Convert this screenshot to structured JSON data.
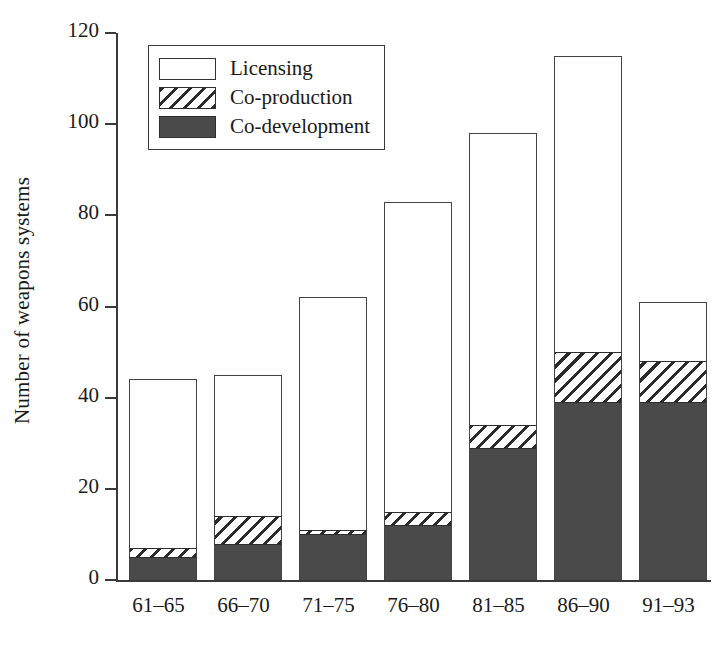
{
  "chart_data": {
    "type": "bar",
    "subtype": "stacked-bar",
    "title": "",
    "xlabel": "",
    "ylabel": "Number of weapons systems",
    "ylim": [
      0,
      120
    ],
    "yticks": [
      0,
      20,
      40,
      60,
      80,
      100,
      120
    ],
    "grid": false,
    "legend_position": "top-left-inside",
    "categories": [
      "61–65",
      "66–70",
      "71–75",
      "76–80",
      "81–85",
      "86–90",
      "91–93"
    ],
    "series": [
      {
        "name": "Co-development",
        "color": "#4a4a4a",
        "pattern": "solid",
        "values": [
          5,
          8,
          10,
          12,
          29,
          39,
          39
        ]
      },
      {
        "name": "Co-production",
        "color": "#2b2b2b",
        "pattern": "hatched",
        "values": [
          2,
          6,
          1,
          3,
          5,
          11,
          9
        ]
      },
      {
        "name": "Licensing",
        "color": "#ffffff",
        "pattern": "open",
        "values": [
          37,
          31,
          51,
          68,
          64,
          65,
          13
        ]
      }
    ],
    "totals": [
      44,
      45,
      62,
      83,
      98,
      115,
      61
    ],
    "stack_order": [
      "Co-development",
      "Co-production",
      "Licensing"
    ]
  },
  "legend": {
    "items": [
      {
        "label": "Licensing",
        "swatch": "open-rect-icon"
      },
      {
        "label": "Co-production",
        "swatch": "hatched-rect-icon"
      },
      {
        "label": "Co-development",
        "swatch": "filled-rect-icon"
      }
    ]
  },
  "axes": {
    "y_title": "Number of weapons systems",
    "y_tick_labels": [
      "0",
      "20",
      "40",
      "60",
      "80",
      "100",
      "120"
    ],
    "x_tick_labels": [
      "61–65",
      "66–70",
      "71–75",
      "76–80",
      "81–85",
      "86–90",
      "91–93"
    ]
  }
}
